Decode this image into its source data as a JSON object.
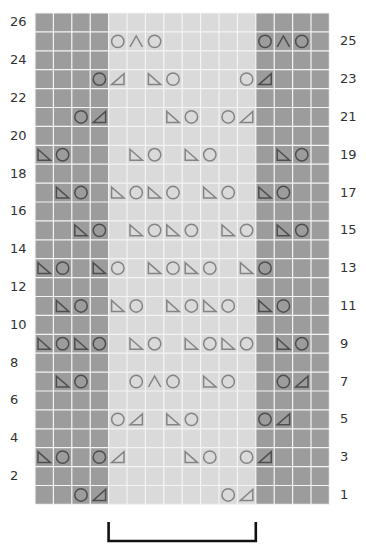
{
  "chart_data": {
    "type": "knitting-chart",
    "columns": 16,
    "rows": 26,
    "grid": {
      "left": 35,
      "top": 13,
      "cell_w": 18.4,
      "cell_h": 18.9
    },
    "colors": {
      "dark_cell": "#9c9c9c",
      "light_cell": "#dadada",
      "gridline": "#f4f4f4",
      "symbol_light": "#848484",
      "symbol_dark": "#4e4e4e",
      "bracket": "#111111",
      "label": "#333333"
    },
    "dark_columns": [
      0,
      1,
      2,
      3,
      12,
      13,
      14,
      15
    ],
    "legend_symbols": {
      "O": "yarn-over",
      "L": "ssk-left-leaning-decrease",
      "R": "k2tog-right-leaning-decrease",
      "A": "double-decrease"
    },
    "left_labels": [
      "26",
      "24",
      "22",
      "20",
      "18",
      "16",
      "14",
      "12",
      "10",
      "8",
      "6",
      "4",
      "2"
    ],
    "right_labels": [
      "25",
      "23",
      "21",
      "19",
      "17",
      "15",
      "13",
      "11",
      "9",
      "7",
      "5",
      "3",
      "1"
    ],
    "symbol_rows": [
      {
        "row": 25,
        "cells": [
          [
            4,
            "O"
          ],
          [
            5,
            "A"
          ],
          [
            6,
            "O"
          ],
          [
            12,
            "O"
          ],
          [
            13,
            "A"
          ],
          [
            14,
            "O"
          ]
        ]
      },
      {
        "row": 23,
        "cells": [
          [
            3,
            "O"
          ],
          [
            4,
            "R"
          ],
          [
            6,
            "L"
          ],
          [
            7,
            "O"
          ],
          [
            11,
            "O"
          ],
          [
            12,
            "R"
          ]
        ]
      },
      {
        "row": 21,
        "cells": [
          [
            2,
            "O"
          ],
          [
            3,
            "R"
          ],
          [
            7,
            "L"
          ],
          [
            8,
            "O"
          ],
          [
            10,
            "O"
          ],
          [
            11,
            "R"
          ]
        ]
      },
      {
        "row": 19,
        "cells": [
          [
            0,
            "L"
          ],
          [
            1,
            "O"
          ],
          [
            5,
            "L"
          ],
          [
            6,
            "O"
          ],
          [
            8,
            "L"
          ],
          [
            9,
            "O"
          ],
          [
            13,
            "L"
          ],
          [
            14,
            "O"
          ]
        ]
      },
      {
        "row": 17,
        "cells": [
          [
            1,
            "L"
          ],
          [
            2,
            "O"
          ],
          [
            4,
            "L"
          ],
          [
            5,
            "O"
          ],
          [
            6,
            "L"
          ],
          [
            7,
            "O"
          ],
          [
            9,
            "L"
          ],
          [
            10,
            "O"
          ],
          [
            12,
            "L"
          ],
          [
            13,
            "O"
          ]
        ]
      },
      {
        "row": 15,
        "cells": [
          [
            2,
            "L"
          ],
          [
            3,
            "O"
          ],
          [
            5,
            "L"
          ],
          [
            6,
            "O"
          ],
          [
            7,
            "L"
          ],
          [
            8,
            "O"
          ],
          [
            10,
            "L"
          ],
          [
            11,
            "O"
          ],
          [
            13,
            "L"
          ],
          [
            14,
            "O"
          ]
        ]
      },
      {
        "row": 13,
        "cells": [
          [
            0,
            "L"
          ],
          [
            1,
            "O"
          ],
          [
            3,
            "L"
          ],
          [
            4,
            "O"
          ],
          [
            6,
            "L"
          ],
          [
            7,
            "O"
          ],
          [
            8,
            "L"
          ],
          [
            9,
            "O"
          ],
          [
            11,
            "L"
          ],
          [
            12,
            "O"
          ]
        ]
      },
      {
        "row": 11,
        "cells": [
          [
            1,
            "L"
          ],
          [
            2,
            "O"
          ],
          [
            4,
            "L"
          ],
          [
            5,
            "O"
          ],
          [
            7,
            "L"
          ],
          [
            8,
            "O"
          ],
          [
            9,
            "L"
          ],
          [
            10,
            "O"
          ],
          [
            12,
            "L"
          ],
          [
            13,
            "O"
          ]
        ]
      },
      {
        "row": 9,
        "cells": [
          [
            0,
            "L"
          ],
          [
            1,
            "O"
          ],
          [
            2,
            "L"
          ],
          [
            3,
            "O"
          ],
          [
            5,
            "L"
          ],
          [
            6,
            "O"
          ],
          [
            8,
            "L"
          ],
          [
            9,
            "O"
          ],
          [
            10,
            "L"
          ],
          [
            11,
            "O"
          ],
          [
            13,
            "L"
          ],
          [
            14,
            "O"
          ]
        ]
      },
      {
        "row": 7,
        "cells": [
          [
            1,
            "L"
          ],
          [
            2,
            "O"
          ],
          [
            5,
            "O"
          ],
          [
            6,
            "A"
          ],
          [
            7,
            "O"
          ],
          [
            9,
            "L"
          ],
          [
            10,
            "O"
          ],
          [
            13,
            "O"
          ],
          [
            14,
            "R"
          ]
        ]
      },
      {
        "row": 5,
        "cells": [
          [
            4,
            "O"
          ],
          [
            5,
            "R"
          ],
          [
            7,
            "L"
          ],
          [
            8,
            "O"
          ],
          [
            12,
            "O"
          ],
          [
            13,
            "R"
          ]
        ]
      },
      {
        "row": 3,
        "cells": [
          [
            0,
            "L"
          ],
          [
            1,
            "O"
          ],
          [
            3,
            "O"
          ],
          [
            4,
            "R"
          ],
          [
            8,
            "L"
          ],
          [
            9,
            "O"
          ],
          [
            11,
            "O"
          ],
          [
            12,
            "R"
          ]
        ]
      },
      {
        "row": 1,
        "cells": [
          [
            2,
            "O"
          ],
          [
            3,
            "R"
          ],
          [
            10,
            "O"
          ],
          [
            11,
            "R"
          ]
        ]
      }
    ],
    "repeat_bracket": {
      "from_col": 4,
      "to_col": 11,
      "label": ""
    }
  }
}
